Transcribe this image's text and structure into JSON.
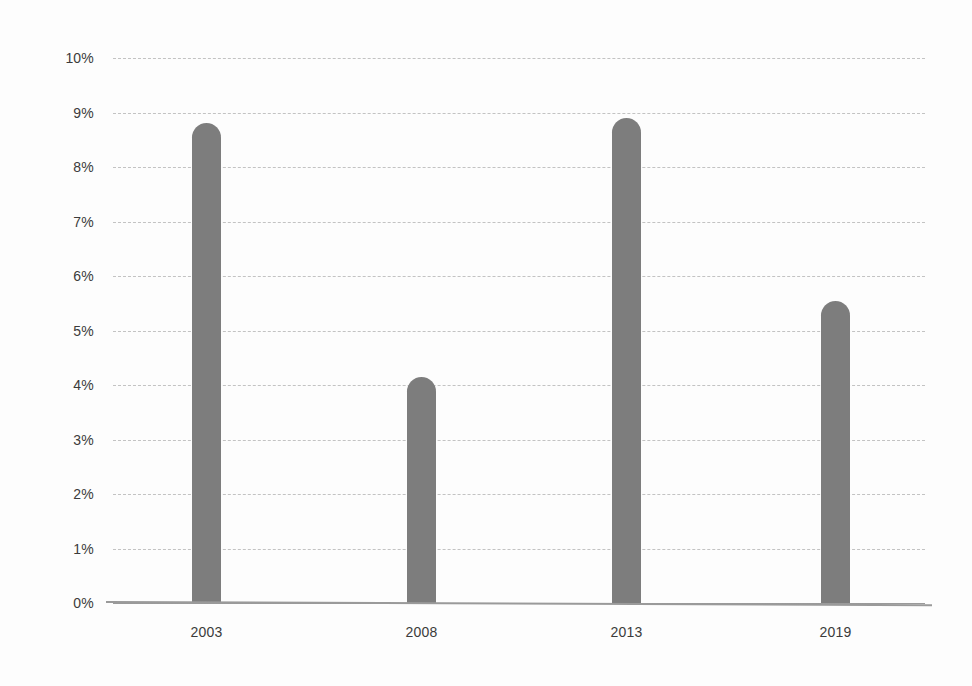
{
  "chart_data": {
    "type": "bar",
    "title": "",
    "subtitle": "",
    "xlabel": "",
    "ylabel": "",
    "categories": [
      "2003",
      "2008",
      "2013",
      "2019"
    ],
    "values": [
      8.8,
      4.15,
      8.9,
      5.55
    ],
    "value_labels": [
      "8.8%",
      "4.15%",
      "8.9%",
      "5.55%"
    ],
    "ylim": [
      0,
      10
    ],
    "ytick_values": [
      0,
      1,
      2,
      3,
      4,
      5,
      6,
      7,
      8,
      9,
      10
    ],
    "ytick_labels": [
      "0%",
      "1%",
      "2%",
      "3%",
      "4%",
      "5%",
      "6%",
      "7%",
      "8%",
      "9%",
      "10%"
    ],
    "grid": true,
    "grid_style": "dashed",
    "legend": null,
    "legend_position": "none",
    "series": [
      {
        "name": "",
        "values": [
          8.8,
          4.15,
          8.9,
          5.55
        ]
      }
    ],
    "colors": {
      "bar": "#7d7d7d",
      "gridline": "#b9b9b9",
      "axis": "#9a9a9a",
      "background": "#fdfdfd",
      "tick_label": "#3b3b3b"
    }
  }
}
